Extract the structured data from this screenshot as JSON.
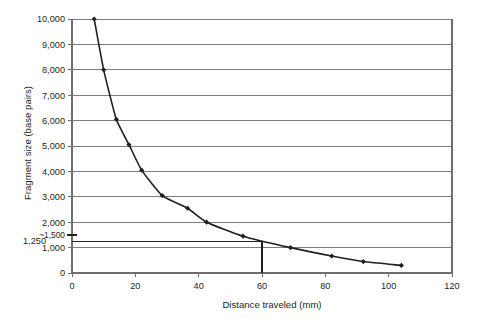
{
  "chart_data": {
    "type": "line",
    "title": "",
    "xlabel": "Distance traveled (mm)",
    "ylabel": "Fragment size (base pairs)",
    "xlim": [
      0,
      120
    ],
    "ylim": [
      0,
      10000
    ],
    "grid": true,
    "legend": "none",
    "x_ticks": [
      0,
      20,
      40,
      60,
      80,
      100,
      120
    ],
    "x_tick_labels": [
      "0",
      "20",
      "40",
      "60",
      "80",
      "100",
      "120"
    ],
    "y_ticks": [
      0,
      1000,
      2000,
      3000,
      4000,
      5000,
      6000,
      7000,
      8000,
      9000,
      10000
    ],
    "y_tick_labels": [
      "0",
      "1,000",
      "2,000",
      "3,000",
      "4,000",
      "5,000",
      "6,000",
      "7,000",
      "8,000",
      "9,000",
      "10,000"
    ],
    "extra_y_labels": [
      {
        "value": 1500,
        "label": "~1,500"
      },
      {
        "value": 1250,
        "label": "1,250"
      }
    ],
    "series": [
      {
        "name": "DNA ladder standard curve",
        "x": [
          7,
          10,
          14,
          18,
          22,
          28.5,
          36.5,
          42.5,
          54,
          69,
          82,
          92,
          104
        ],
        "values": [
          10000,
          8000,
          6050,
          5050,
          4050,
          3050,
          2550,
          2000,
          1450,
          1000,
          670,
          450,
          300
        ]
      }
    ],
    "annotations": [
      {
        "type": "horizontal-reference-line",
        "y": 1250,
        "x_from": 0,
        "x_to": 60,
        "label": "1,250"
      },
      {
        "type": "vertical-reference-line",
        "x": 60,
        "y_from": 0,
        "y_to": 1250,
        "label": "60"
      }
    ]
  },
  "figure": {
    "x_axis_title": "Distance traveled (mm)",
    "y_axis_title": "Fragment size (base pairs)"
  }
}
